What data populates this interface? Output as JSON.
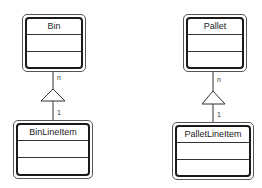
{
  "diagram": {
    "type": "UML class diagram",
    "classes": [
      {
        "id": "bin",
        "name": "Bin"
      },
      {
        "id": "binlineitem",
        "name": "BinLineItem"
      },
      {
        "id": "pallet",
        "name": "Pallet"
      },
      {
        "id": "palletlineitem",
        "name": "PalletLineItem"
      }
    ],
    "associations": [
      {
        "from": "Bin",
        "to": "BinLineItem",
        "from_multiplicity": "n",
        "to_multiplicity": "1",
        "symbol": "triangle"
      },
      {
        "from": "Pallet",
        "to": "PalletLineItem",
        "from_multiplicity": "n",
        "to_multiplicity": "1",
        "symbol": "triangle"
      }
    ]
  },
  "labels": {
    "bin": "Bin",
    "binlineitem": "BinLineItem",
    "pallet": "Pallet",
    "palletlineitem": "PalletLineItem",
    "mult_n": "n",
    "mult_1": "1"
  }
}
